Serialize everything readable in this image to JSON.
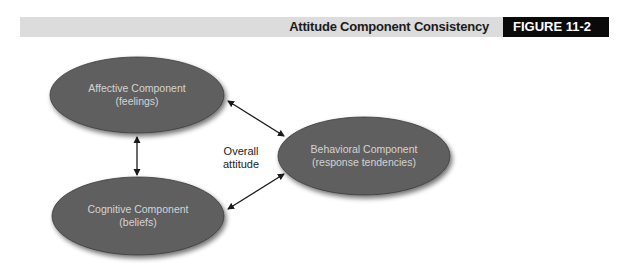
{
  "header": {
    "title": "Attitude Component Consistency",
    "figure_label": "FIGURE 11-2"
  },
  "diagram": {
    "center_label": {
      "line1": "Overall",
      "line2": "attitude"
    },
    "nodes": [
      {
        "id": "affective",
        "line1": "Affective Component",
        "line2": "(feelings)"
      },
      {
        "id": "cognitive",
        "line1": "Cognitive Component",
        "line2": "(beliefs)"
      },
      {
        "id": "behavioral",
        "line1": "Behavioral Component",
        "line2": "(response tendencies)"
      }
    ],
    "edges": [
      {
        "from": "affective",
        "to": "cognitive",
        "type": "bidirectional"
      },
      {
        "from": "affective",
        "to": "behavioral",
        "type": "bidirectional"
      },
      {
        "from": "cognitive",
        "to": "behavioral",
        "type": "bidirectional"
      }
    ],
    "colors": {
      "node_fill": "#5e5e5e",
      "node_text": "#d4d4d4",
      "arrow": "#1a1a1a",
      "header_bar": "#dcdcdc",
      "figure_label_bg": "#0a0a0a"
    }
  }
}
